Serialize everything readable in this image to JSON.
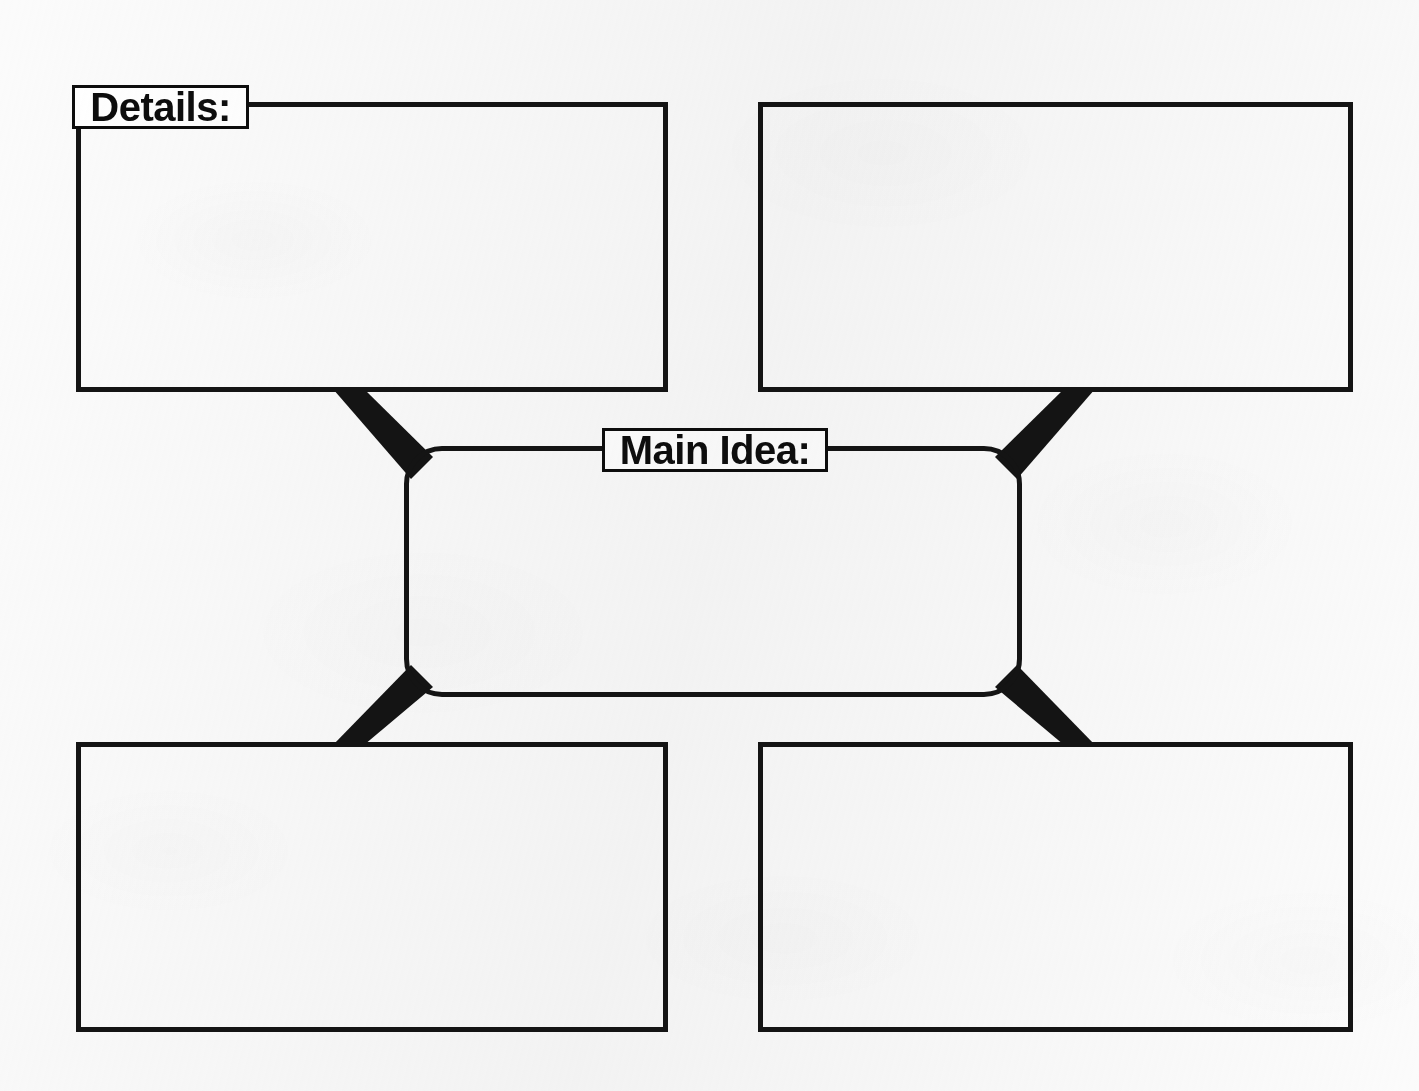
{
  "worksheet": {
    "type": "graphic-organizer",
    "title": "Main Idea and Details Graphic Organizer",
    "background_color": "#fbfbfb",
    "ink_color": "#141414",
    "paper_color": "#ffffff"
  },
  "labels": {
    "details": "Details:",
    "main_idea": "Main Idea:"
  },
  "center_node": {
    "label": "Main Idea:",
    "value": "",
    "shape": "rounded-rectangle",
    "x": 404,
    "y": 446,
    "width": 618,
    "height": 251
  },
  "detail_boxes": [
    {
      "id": "top-left",
      "label": "Details:",
      "value": "",
      "x": 76,
      "y": 102,
      "width": 592,
      "height": 290,
      "has_label": true
    },
    {
      "id": "top-right",
      "label": "",
      "value": "",
      "x": 758,
      "y": 102,
      "width": 595,
      "height": 290,
      "has_label": false
    },
    {
      "id": "bottom-left",
      "label": "",
      "value": "",
      "x": 76,
      "y": 742,
      "width": 592,
      "height": 290,
      "has_label": false
    },
    {
      "id": "bottom-right",
      "label": "",
      "value": "",
      "x": 758,
      "y": 742,
      "width": 595,
      "height": 290,
      "has_label": false
    }
  ],
  "connectors": [
    {
      "id": "top-left-connector",
      "from": "top-left",
      "to": "center",
      "style": "thick-diagonal"
    },
    {
      "id": "top-right-connector",
      "from": "top-right",
      "to": "center",
      "style": "thick-diagonal"
    },
    {
      "id": "bottom-left-connector",
      "from": "bottom-left",
      "to": "center",
      "style": "thick-diagonal"
    },
    {
      "id": "bottom-right-connector",
      "from": "bottom-right",
      "to": "center",
      "style": "thick-diagonal"
    }
  ]
}
